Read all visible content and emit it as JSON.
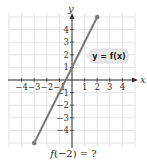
{
  "chart_data": {
    "type": "line",
    "title": "",
    "xlabel": "x",
    "ylabel": "y",
    "xlim": [
      -5,
      5
    ],
    "ylim": [
      -5.3,
      5.3
    ],
    "grid": true,
    "x_ticks": [
      -4,
      -3,
      -2,
      -1,
      1,
      2,
      3,
      4
    ],
    "y_ticks": [
      -4,
      -3,
      -2,
      -1,
      1,
      2,
      3,
      4
    ],
    "x_tick_labels": [
      "−4",
      "−3",
      "−2",
      "−1",
      "1",
      "2",
      "3",
      "4"
    ],
    "y_tick_labels": [
      "−4",
      "−3",
      "−2",
      "−1",
      "1",
      "2",
      "3",
      "4"
    ],
    "series": [
      {
        "name": "y = f(x)",
        "function": "f(x) = 2x + 1",
        "x": [
          -3,
          2
        ],
        "y": [
          -5,
          5
        ],
        "endpoints": "closed dots",
        "color": "#7a7a7a"
      }
    ],
    "annotations": [
      {
        "text": "y = f(x)",
        "x": 2.3,
        "y": 2,
        "style": "rounded gray callout box"
      }
    ],
    "legend": "none"
  },
  "labels": {
    "x_axis": "x",
    "y_axis": "y",
    "function_label": "y = f(x)",
    "question_prefix": "f",
    "question_arg": "(−2) = ?"
  },
  "colors": {
    "grid": "#d9d9d9",
    "axis": "#333333",
    "line": "#7a7a7a",
    "label_box": "#e6e6e6"
  }
}
